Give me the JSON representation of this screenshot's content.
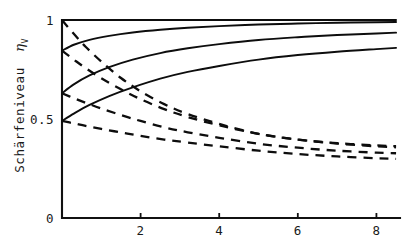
{
  "chart_data": {
    "type": "line",
    "title": "",
    "subtitle": "",
    "xlabel": "",
    "ylabel": "Schärfeniveau",
    "ylabel_symbol": "η",
    "ylabel_symbol_sub": "V",
    "xlim": [
      0,
      8.6
    ],
    "ylim": [
      0,
      1.04
    ],
    "x_ticks": [
      2,
      4,
      6,
      8
    ],
    "x_tick_labels": [
      "2",
      "4",
      "6",
      "8"
    ],
    "y_ticks": [
      0,
      0.5,
      1
    ],
    "y_tick_labels": [
      "0",
      "0.5",
      "1"
    ],
    "grid": false,
    "legend": "none",
    "annotations": [],
    "series": [
      {
        "name": "solid-1",
        "style": "solid",
        "x": [
          0,
          0.4,
          1,
          1.8,
          2.6,
          3.4,
          4.2,
          5,
          6,
          7,
          8,
          8.5
        ],
        "values": [
          1.0,
          1.0,
          1.0,
          1.0,
          1.0,
          1.0,
          1.0,
          1.0,
          1.0,
          1.0,
          1.0,
          1.0
        ]
      },
      {
        "name": "solid-2",
        "style": "solid",
        "x": [
          0,
          0.3,
          0.7,
          1.2,
          1.8,
          2.5,
          3.2,
          4,
          5,
          6,
          7,
          8,
          8.5
        ],
        "values": [
          0.845,
          0.875,
          0.9,
          0.92,
          0.937,
          0.951,
          0.961,
          0.969,
          0.977,
          0.982,
          0.986,
          0.989,
          0.99
        ]
      },
      {
        "name": "solid-3",
        "style": "solid",
        "x": [
          0,
          0.3,
          0.7,
          1.2,
          1.8,
          2.5,
          3.2,
          4,
          5,
          6,
          7,
          8,
          8.5
        ],
        "values": [
          0.63,
          0.675,
          0.72,
          0.762,
          0.8,
          0.833,
          0.857,
          0.878,
          0.899,
          0.913,
          0.924,
          0.932,
          0.936
        ]
      },
      {
        "name": "solid-4",
        "style": "solid",
        "x": [
          0,
          0.3,
          0.7,
          1.2,
          1.8,
          2.5,
          3.2,
          4,
          5,
          6,
          7,
          8,
          8.5
        ],
        "values": [
          0.49,
          0.527,
          0.571,
          0.616,
          0.66,
          0.704,
          0.738,
          0.768,
          0.8,
          0.823,
          0.84,
          0.853,
          0.859
        ]
      },
      {
        "name": "dashed-1",
        "style": "dashed",
        "x": [
          0,
          0.3,
          0.6,
          1,
          1.5,
          2,
          2.6,
          3.2,
          4,
          5,
          6,
          7,
          8,
          8.5
        ],
        "values": [
          1.0,
          0.93,
          0.865,
          0.79,
          0.707,
          0.64,
          0.575,
          0.525,
          0.475,
          0.425,
          0.396,
          0.378,
          0.367,
          0.363
        ]
      },
      {
        "name": "dashed-2",
        "style": "dashed",
        "x": [
          0,
          0.3,
          0.6,
          1,
          1.5,
          2,
          2.6,
          3.2,
          4,
          5,
          6,
          7,
          8,
          8.5
        ],
        "values": [
          0.845,
          0.8,
          0.757,
          0.706,
          0.65,
          0.6,
          0.55,
          0.51,
          0.468,
          0.425,
          0.396,
          0.376,
          0.362,
          0.357
        ]
      },
      {
        "name": "dashed-3",
        "style": "dashed",
        "x": [
          0,
          0.3,
          0.6,
          1,
          1.5,
          2,
          2.6,
          3.2,
          4,
          5,
          6,
          7,
          8,
          8.5
        ],
        "values": [
          0.63,
          0.605,
          0.582,
          0.553,
          0.52,
          0.49,
          0.458,
          0.433,
          0.405,
          0.375,
          0.355,
          0.34,
          0.33,
          0.327
        ]
      },
      {
        "name": "dashed-4",
        "style": "dashed",
        "x": [
          0,
          0.3,
          0.6,
          1,
          1.5,
          2,
          2.6,
          3.2,
          4,
          5,
          6,
          7,
          8,
          8.5
        ],
        "values": [
          0.49,
          0.478,
          0.465,
          0.45,
          0.432,
          0.415,
          0.396,
          0.381,
          0.362,
          0.34,
          0.323,
          0.311,
          0.302,
          0.299
        ]
      }
    ]
  },
  "colors": {
    "ink": "#0d0d0d",
    "background": "#ffffff"
  }
}
